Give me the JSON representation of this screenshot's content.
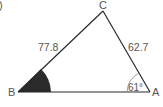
{
  "figure": {
    "part_label": ")",
    "vertices": {
      "A": {
        "label": "A"
      },
      "B": {
        "label": "B"
      },
      "C": {
        "label": "C"
      }
    },
    "sides": {
      "BC": {
        "label": "77.8"
      },
      "CA": {
        "label": "62.7"
      }
    },
    "angles": {
      "A": {
        "label": "61°"
      },
      "B": {
        "label": "",
        "highlighted": true
      }
    },
    "colors": {
      "line": "#2a2a2a",
      "text": "#555555",
      "fill": "#2a2a2a"
    }
  }
}
